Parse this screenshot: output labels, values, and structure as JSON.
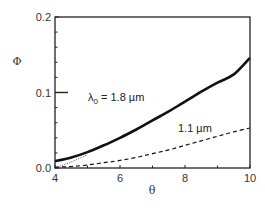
{
  "chart_data": {
    "type": "line",
    "title": "",
    "xlabel": "θ",
    "ylabel": "Φ",
    "xlim": [
      4,
      10
    ],
    "ylim": [
      0.0,
      0.2
    ],
    "xticks": [
      4,
      6,
      8,
      10
    ],
    "xtick_labels": [
      "4",
      "6",
      "8",
      "10"
    ],
    "xminor_ticks": [
      5,
      7,
      9
    ],
    "yticks": [
      0.0,
      0.1,
      0.2
    ],
    "ytick_labels": [
      "0.0",
      "0.1",
      "0.2"
    ],
    "yminor_ticks": [
      0.02,
      0.04,
      0.06,
      0.08,
      0.12,
      0.14,
      0.16,
      0.18
    ],
    "grid": false,
    "legend": "inline annotations",
    "series": [
      {
        "name": "λ0 = 1.8 µm",
        "style": "solid-thick",
        "x": [
          4,
          4.5,
          5,
          5.5,
          6,
          6.5,
          7,
          7.5,
          8,
          8.5,
          9,
          9.5,
          10
        ],
        "y": [
          0.009,
          0.014,
          0.021,
          0.03,
          0.04,
          0.051,
          0.063,
          0.075,
          0.088,
          0.101,
          0.113,
          0.124,
          0.146
        ]
      },
      {
        "name": "1.1 µm",
        "style": "dashed",
        "x": [
          4,
          4.5,
          5,
          5.5,
          6,
          6.5,
          7,
          7.5,
          8,
          8.5,
          9,
          9.5,
          10
        ],
        "y": [
          0.001,
          0.002,
          0.004,
          0.007,
          0.01,
          0.014,
          0.019,
          0.024,
          0.03,
          0.036,
          0.042,
          0.048,
          0.053
        ]
      },
      {
        "name": "asymptote",
        "style": "dotted",
        "x": [
          4,
          4.5,
          5
        ],
        "y": [
          0.0,
          0.008,
          0.018
        ]
      }
    ],
    "annotations": [
      {
        "text_main": "λ",
        "text_sub": "0",
        "text_rest": " = 1.8 µm",
        "x": 4.7,
        "y": 0.096
      },
      {
        "text": "1.1 µm",
        "x": 7.6,
        "y": 0.044
      }
    ],
    "reference_marker": {
      "y": 0.1,
      "x_from": 4,
      "x_to": 4.4
    }
  }
}
